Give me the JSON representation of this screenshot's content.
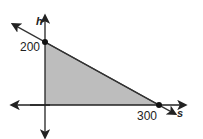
{
  "chart_data": {
    "type": "area",
    "title": "",
    "xlabel": "s",
    "ylabel": "h",
    "tick_labels": {
      "x": [
        "300"
      ],
      "y": [
        "200"
      ]
    },
    "line": {
      "x": [
        0,
        300
      ],
      "y": [
        200,
        0
      ],
      "equation": "h = 200 - (2/3)s"
    },
    "points": [
      {
        "x": 0,
        "y": 200,
        "label": "200"
      },
      {
        "x": 300,
        "y": 0,
        "label": "300"
      }
    ],
    "shaded_region": [
      [
        0,
        0
      ],
      [
        0,
        200
      ],
      [
        300,
        0
      ]
    ],
    "colors": {
      "fill": "#bdbdbd",
      "line": "#333333",
      "axis": "#222222"
    }
  }
}
